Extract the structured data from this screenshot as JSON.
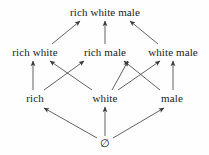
{
  "diagram": {
    "background_color": "#fefefe",
    "line_color": "#3a3a3a",
    "text_color": "#1a1a1a",
    "nodes": [
      {
        "id": "rwm",
        "label": "rich white male",
        "x": 105,
        "y": 12,
        "level": 3
      },
      {
        "id": "rw",
        "label": "rich white",
        "x": 35,
        "y": 52,
        "level": 2
      },
      {
        "id": "rm",
        "label": "rich male",
        "x": 105,
        "y": 52,
        "level": 2
      },
      {
        "id": "wm",
        "label": "white male",
        "x": 173,
        "y": 52,
        "level": 2
      },
      {
        "id": "r",
        "label": "rich",
        "x": 35,
        "y": 98,
        "level": 1
      },
      {
        "id": "w",
        "label": "white",
        "x": 105,
        "y": 98,
        "level": 1
      },
      {
        "id": "m",
        "label": "male",
        "x": 172,
        "y": 98,
        "level": 1
      },
      {
        "id": "empty",
        "label": "∅",
        "x": 105,
        "y": 143,
        "level": 0
      }
    ],
    "edges": [
      {
        "from": "rw",
        "to": "rwm",
        "x1": 52,
        "y1": 44,
        "x2": 80,
        "y2": 21
      },
      {
        "from": "rm",
        "to": "rwm",
        "x1": 105,
        "y1": 44,
        "x2": 105,
        "y2": 21
      },
      {
        "from": "wm",
        "to": "rwm",
        "x1": 158,
        "y1": 44,
        "x2": 130,
        "y2": 21
      },
      {
        "from": "r",
        "to": "rw",
        "x1": 33,
        "y1": 90,
        "x2": 33,
        "y2": 61
      },
      {
        "from": "r",
        "to": "rm",
        "x1": 44,
        "y1": 90,
        "x2": 84,
        "y2": 61
      },
      {
        "from": "w",
        "to": "rw",
        "x1": 92,
        "y1": 90,
        "x2": 50,
        "y2": 61
      },
      {
        "from": "w",
        "to": "rm",
        "x1": 112,
        "y1": 90,
        "x2": 128,
        "y2": 61
      },
      {
        "from": "w",
        "to": "wm",
        "x1": 118,
        "y1": 90,
        "x2": 160,
        "y2": 61
      },
      {
        "from": "m",
        "to": "rm",
        "x1": 160,
        "y1": 90,
        "x2": 124,
        "y2": 61
      },
      {
        "from": "m",
        "to": "wm",
        "x1": 173,
        "y1": 90,
        "x2": 173,
        "y2": 61
      },
      {
        "from": "empty",
        "to": "r",
        "x1": 97,
        "y1": 138,
        "x2": 44,
        "y2": 108
      },
      {
        "from": "empty",
        "to": "w",
        "x1": 105,
        "y1": 136,
        "x2": 105,
        "y2": 107
      },
      {
        "from": "empty",
        "to": "m",
        "x1": 113,
        "y1": 138,
        "x2": 164,
        "y2": 108
      }
    ]
  }
}
